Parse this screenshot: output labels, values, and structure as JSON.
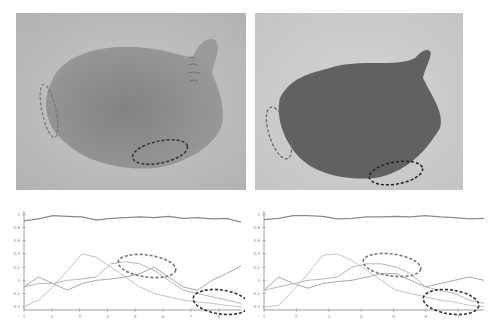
{
  "figure": {
    "panels": [
      {
        "id": "photo-left",
        "kind": "photograph",
        "subject": "bulb-shaped soft object, light grey",
        "annotations": [
          "dashed-ellipse-left-edge",
          "dashed-ellipse-bottom"
        ]
      },
      {
        "id": "photo-right",
        "kind": "photograph",
        "subject": "bulb-shaped soft object, dark grey",
        "annotations": [
          "dashed-ellipse-left-edge",
          "dashed-ellipse-bottom"
        ]
      }
    ]
  },
  "chart_data": [
    {
      "type": "line",
      "title": "",
      "xlabel": "",
      "ylabel": "",
      "x": [
        1,
        1.5,
        2,
        2.5,
        3,
        3.5,
        4,
        4.5,
        5,
        5.5,
        6,
        6.5,
        7,
        7.5,
        8,
        8.5
      ],
      "yticks": [
        "1",
        "0.8",
        "0.6",
        "0.4",
        "0.2",
        "0",
        "-0.2",
        "-0.4"
      ],
      "xticks": [
        "1",
        "2",
        "3",
        "4",
        "5",
        "6",
        "7",
        "8"
      ],
      "ylim": [
        -0.45,
        1.05
      ],
      "grid": false,
      "series": [
        {
          "name": "top",
          "values": [
            0.9,
            0.93,
            0.98,
            0.97,
            0.96,
            0.91,
            0.94,
            0.95,
            0.96,
            0.95,
            0.97,
            0.94,
            0.95,
            0.93,
            0.94,
            0.88
          ]
        },
        {
          "name": "series-a",
          "values": [
            -0.4,
            -0.3,
            -0.1,
            0.15,
            0.4,
            0.35,
            0.2,
            0.05,
            -0.1,
            -0.2,
            -0.25,
            -0.3,
            -0.33,
            -0.35,
            -0.38,
            -0.4
          ]
        },
        {
          "name": "series-b",
          "values": [
            -0.1,
            0.05,
            -0.05,
            -0.15,
            -0.05,
            0.0,
            0.02,
            0.05,
            0.1,
            0.2,
            0.05,
            -0.1,
            -0.15,
            0.0,
            0.1,
            0.22
          ]
        },
        {
          "name": "series-c",
          "values": [
            -0.1,
            -0.05,
            -0.05,
            0.0,
            0.02,
            0.05,
            0.25,
            0.28,
            0.25,
            0.15,
            0.0,
            -0.15,
            -0.2,
            -0.25,
            -0.3,
            -0.35
          ]
        }
      ],
      "annotations": [
        "dashed-ellipse-upper",
        "dashed-ellipse-lower"
      ]
    },
    {
      "type": "line",
      "title": "",
      "xlabel": "",
      "ylabel": "",
      "x": [
        1,
        1.5,
        2,
        2.5,
        3,
        3.5,
        4,
        4.5,
        5,
        5.5,
        6,
        6.5,
        7,
        7.5,
        8,
        8.5
      ],
      "yticks": [
        "1",
        "0.8",
        "0.6",
        "0.4",
        "0.2",
        "0",
        "-0.2",
        "-0.4"
      ],
      "xticks": [
        "1",
        "2",
        "3",
        "4",
        "5",
        "6",
        "7"
      ],
      "ylim": [
        -0.45,
        1.05
      ],
      "grid": false,
      "series": [
        {
          "name": "top",
          "values": [
            0.92,
            0.94,
            0.98,
            0.98,
            0.97,
            0.93,
            0.94,
            0.96,
            0.96,
            0.97,
            0.96,
            0.98,
            0.96,
            0.95,
            0.93,
            0.94
          ]
        },
        {
          "name": "series-a",
          "values": [
            -0.4,
            -0.38,
            -0.15,
            0.1,
            0.38,
            0.4,
            0.3,
            0.15,
            0.0,
            -0.15,
            -0.2,
            -0.25,
            -0.3,
            -0.33,
            -0.38,
            -0.4
          ]
        },
        {
          "name": "series-b",
          "values": [
            -0.15,
            0.05,
            -0.05,
            -0.12,
            -0.05,
            -0.02,
            0.0,
            0.05,
            0.1,
            0.1,
            0.0,
            -0.1,
            -0.05,
            0.0,
            0.05,
            0.0
          ]
        },
        {
          "name": "series-c",
          "values": [
            -0.15,
            -0.1,
            -0.05,
            0.0,
            0.02,
            0.05,
            0.2,
            0.25,
            0.25,
            0.2,
            0.1,
            -0.1,
            -0.15,
            -0.2,
            -0.3,
            -0.35
          ]
        }
      ],
      "annotations": [
        "dashed-ellipse-upper",
        "dashed-ellipse-lower"
      ]
    }
  ]
}
